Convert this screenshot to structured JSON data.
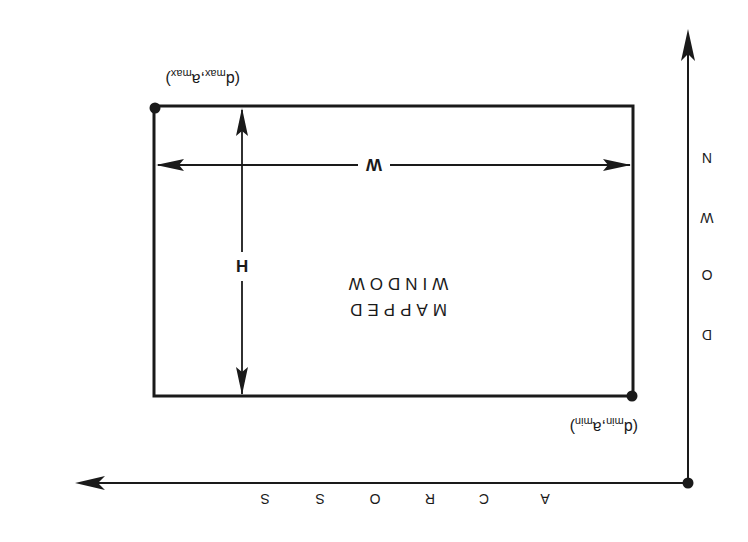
{
  "diagram": {
    "orientation": "rotated-180",
    "colors": {
      "ink": "#1a1a1a",
      "background": "#ffffff"
    },
    "window_label": [
      "MAPPED",
      "WINDOW"
    ],
    "width_label": "W",
    "height_label": "H",
    "axes": {
      "horizontal": {
        "label": "ACROSS",
        "letters": [
          "A",
          "C",
          "R",
          "O",
          "S",
          "S"
        ]
      },
      "vertical": {
        "label": "DOWN",
        "letters": [
          "D",
          "O",
          "W",
          "N"
        ]
      }
    },
    "corners": {
      "min": {
        "d": "d",
        "d_sub": "min",
        "a": "a",
        "a_sub": "min",
        "sep": ","
      },
      "max": {
        "d": "d",
        "d_sub": "max",
        "a": "a",
        "a_sub": "max",
        "sep": ","
      }
    }
  }
}
